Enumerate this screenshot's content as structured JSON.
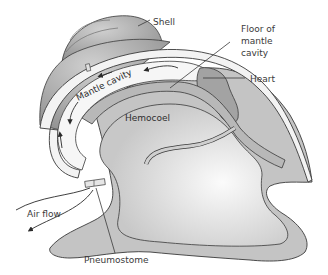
{
  "diagram": {
    "labels": {
      "shell": "Shell",
      "floor_line1": "Floor of",
      "floor_line2": "mantle",
      "floor_line3": "cavity",
      "heart": "Heart",
      "mantle_cavity": "Mantle cavity",
      "hemocoel": "Hemocoel",
      "air_flow": "Air flow",
      "pneumostome": "Pneumostome"
    },
    "colors": {
      "background": "#ffffff",
      "outline": "#3a3a3a",
      "shell": "#b9b9b9",
      "shell_dark": "#8f8f8f",
      "body": "#c4c4c4",
      "mantle": "#efefef",
      "hemocoel": "#d9d9d9",
      "heart": "#a5a5a5",
      "text": "#3a3a3a"
    }
  }
}
